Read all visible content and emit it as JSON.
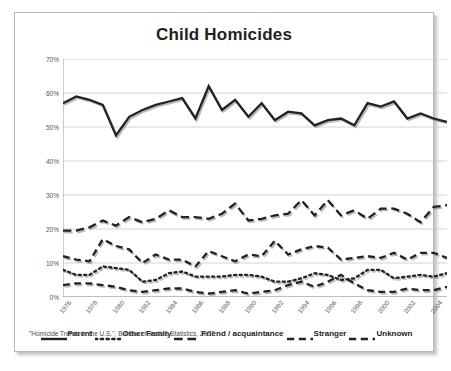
{
  "figure": {
    "title": "Child Homicides",
    "footnote": "\"Homicide Trends in the U.S.\", Bureau of Justice Statistics, 2007",
    "frame_color": "#b9b9b9",
    "background": "#ffffff",
    "line_color": "#222222",
    "grid_color": "#c8c8c8"
  },
  "chart_data": {
    "type": "line",
    "title": "Child Homicides",
    "xlabel": "",
    "ylabel": "",
    "ylim": [
      0,
      70
    ],
    "ytick_labels": [
      "0%",
      "10%",
      "20%",
      "30%",
      "40%",
      "50%",
      "60%",
      "70%"
    ],
    "ytick_values": [
      0,
      10,
      20,
      30,
      40,
      50,
      60,
      70
    ],
    "grid": true,
    "legend_position": "bottom",
    "x": [
      1976,
      1977,
      1978,
      1979,
      1980,
      1981,
      1982,
      1983,
      1984,
      1985,
      1986,
      1987,
      1988,
      1989,
      1990,
      1991,
      1992,
      1993,
      1994,
      1995,
      1996,
      1997,
      1998,
      1999,
      2000,
      2001,
      2002,
      2003,
      2004,
      2005
    ],
    "xtick_labels": [
      "1976",
      "1978",
      "1980",
      "1982",
      "1984",
      "1986",
      "1988",
      "1990",
      "1992",
      "1994",
      "1996",
      "1998",
      "2000",
      "2002",
      "2004"
    ],
    "xtick_values": [
      1976,
      1978,
      1980,
      1982,
      1984,
      1986,
      1988,
      1990,
      1992,
      1994,
      1996,
      1998,
      2000,
      2002,
      2004
    ],
    "series": [
      {
        "name": "Parent",
        "dash": "solid",
        "values": [
          57.0,
          59.0,
          58.0,
          56.5,
          47.5,
          53.0,
          55.0,
          56.5,
          57.5,
          58.5,
          52.5,
          62.0,
          55.0,
          58.0,
          53.0,
          57.0,
          52.0,
          54.5,
          54.0,
          50.5,
          52.0,
          52.5,
          50.5,
          57.0,
          56.0,
          57.5,
          52.5,
          54.0,
          52.5,
          51.5
        ]
      },
      {
        "name": "Other Family",
        "dash": "dotted",
        "values": [
          8.0,
          6.5,
          6.5,
          9.0,
          8.5,
          8.0,
          4.5,
          5.0,
          7.0,
          7.5,
          6.0,
          6.0,
          6.0,
          6.5,
          6.5,
          6.0,
          4.5,
          4.5,
          5.5,
          7.0,
          6.5,
          5.0,
          5.5,
          8.0,
          8.0,
          5.5,
          6.0,
          6.5,
          6.0,
          7.0
        ]
      },
      {
        "name": "Friend / acquaintance",
        "dash": "long-dash",
        "values": [
          19.5,
          19.5,
          20.5,
          22.5,
          21.0,
          23.5,
          22.0,
          23.0,
          25.5,
          23.5,
          23.5,
          23.0,
          24.5,
          27.5,
          22.5,
          23.0,
          24.0,
          24.5,
          28.5,
          24.0,
          28.5,
          24.0,
          25.5,
          23.0,
          26.0,
          26.0,
          24.5,
          22.0,
          26.5,
          27.0
        ]
      },
      {
        "name": "Stranger",
        "dash": "medium-dash",
        "values": [
          12.0,
          11.0,
          10.5,
          17.0,
          15.0,
          14.0,
          10.0,
          12.5,
          11.0,
          11.0,
          9.0,
          13.5,
          12.0,
          10.5,
          12.5,
          12.0,
          16.5,
          12.5,
          14.0,
          15.0,
          14.5,
          11.0,
          11.5,
          12.0,
          11.5,
          13.0,
          11.0,
          13.0,
          13.0,
          11.5
        ]
      },
      {
        "name": "Unknown",
        "dash": "medium-dash",
        "values": [
          3.5,
          4.0,
          4.0,
          3.5,
          3.0,
          2.0,
          1.5,
          2.0,
          2.5,
          2.5,
          1.5,
          1.0,
          1.5,
          2.0,
          1.0,
          1.5,
          2.0,
          3.5,
          4.5,
          3.0,
          4.5,
          6.5,
          4.0,
          2.0,
          1.5,
          1.5,
          2.5,
          2.0,
          2.0,
          3.0
        ]
      }
    ]
  },
  "legend": {
    "items": [
      {
        "label": "Parent",
        "dash": "solid"
      },
      {
        "label": "Other Family",
        "dash": "dotted"
      },
      {
        "label": "Friend / acquaintance",
        "dash": "long-dash"
      },
      {
        "label": "Stranger",
        "dash": "medium-dash"
      },
      {
        "label": "Unknown",
        "dash": "medium-dash"
      }
    ]
  }
}
